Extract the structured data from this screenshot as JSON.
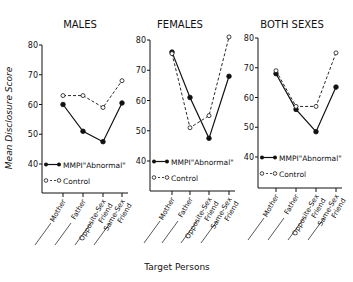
{
  "chart_data": [
    {
      "type": "line",
      "title": "MALES",
      "categories": [
        "Mother",
        "Father",
        "Opposite-Sex Friend",
        "Same-Sex Friend"
      ],
      "series": [
        {
          "name": "MMPI \"Abnormal\"",
          "style": "solid-filled-circle",
          "values": [
            60,
            51,
            47.5,
            60.5
          ]
        },
        {
          "name": "Control",
          "style": "dashed-open-circle",
          "values": [
            63,
            63,
            59,
            68
          ]
        }
      ],
      "xlabel": "Target Persons",
      "ylabel": "Mean Disclosure Score",
      "ylim": [
        40,
        80
      ],
      "yticks": [
        40,
        50,
        60,
        70,
        80
      ],
      "grid": false
    },
    {
      "type": "line",
      "title": "FEMALES",
      "categories": [
        "Mother",
        "Father",
        "Opposite-Sex Friend",
        "Same-Sex Friend"
      ],
      "series": [
        {
          "name": "MMPI \"Abnormal\"",
          "style": "solid-filled-circle",
          "values": [
            76,
            61,
            47.5,
            68
          ]
        },
        {
          "name": "Control",
          "style": "dashed-open-circle",
          "values": [
            75.5,
            51,
            55,
            81
          ]
        }
      ],
      "xlabel": "Target Persons",
      "ylabel": "Mean Disclosure Score",
      "ylim": [
        40,
        80
      ],
      "yticks": [
        40,
        50,
        60,
        70,
        80
      ],
      "grid": false
    },
    {
      "type": "line",
      "title": "BOTH SEXES",
      "categories": [
        "Mother",
        "Father",
        "Opposite-Sex Friend",
        "Same-Sex Friend"
      ],
      "series": [
        {
          "name": "MMPI \"Abnormal\"",
          "style": "solid-filled-circle",
          "values": [
            68,
            56,
            48.5,
            63.5
          ]
        },
        {
          "name": "Control",
          "style": "dashed-open-circle",
          "values": [
            69,
            57,
            57,
            75
          ]
        }
      ],
      "xlabel": "Target Persons",
      "ylabel": "Mean Disclosure Score",
      "ylim": [
        40,
        80
      ],
      "yticks": [
        40,
        50,
        60,
        70,
        80
      ],
      "grid": false
    }
  ],
  "labels": {
    "ylabel": "Mean Disclosure Score",
    "xlabel": "Target Persons",
    "legend_abnormal": "MMPI\"Abnormal\"",
    "legend_control": "Control",
    "cat_lines": [
      [
        "Mother"
      ],
      [
        "Father"
      ],
      [
        "Opposite-Sex",
        "Friend"
      ],
      [
        "Same-Sex",
        "Friend"
      ]
    ]
  },
  "colors": {
    "ink": "#111111",
    "background": "#ffffff"
  }
}
